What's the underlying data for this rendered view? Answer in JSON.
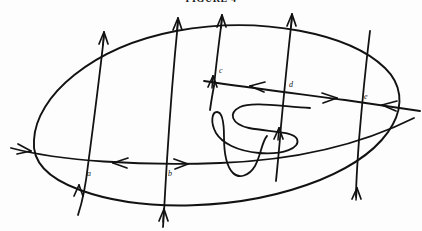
{
  "figure": {
    "caption": "FIGURE 4",
    "background_color": "#fdfdfd",
    "ink_color": "#121212",
    "width": 422,
    "height": 231,
    "kind": "hand-drawn line diagram"
  },
  "labels": {
    "a": "a",
    "b": "b",
    "c": "c",
    "d": "d",
    "e": "e"
  },
  "geometry": {
    "ellipse": {
      "name": "outer-loop",
      "path": "M 34,140 C 36,96 92,47 176,31 C 262,15 350,34 385,68 C 418,100 394,150 320,180 C 240,212 140,212 80,190 C 44,177 32,160 34,140 Z"
    },
    "vertical_curves": [
      {
        "name": "curve-a",
        "path": "M 104,33 C 100,70 94,120 88,165 C 84,192 80,204 78,214",
        "arrow_top": {
          "x": 104,
          "y": 33,
          "dir": "up"
        },
        "arrow_bottom": {
          "x": 78,
          "y": 186,
          "dir": "up"
        },
        "label": "a",
        "label_x": 87,
        "label_y": 175
      },
      {
        "name": "curve-b",
        "path": "M 178,19 C 174,60 170,110 166,160 C 164,192 164,212 163,226",
        "arrow_top": {
          "x": 178,
          "y": 19,
          "dir": "up"
        },
        "arrow_bottom": {
          "x": 163,
          "y": 211,
          "dir": "up"
        },
        "label": "b",
        "label_x": 168,
        "label_y": 176
      },
      {
        "name": "curve-c",
        "path": "M 222,16 C 219,40 216,66 214,86 C 212,96 211,102 210,108",
        "arrow_top": {
          "x": 222,
          "y": 16,
          "dir": "up"
        },
        "arrow_bottom": {
          "x": 212,
          "y": 78,
          "dir": "up"
        },
        "label": "c",
        "label_x": 219,
        "label_y": 72
      },
      {
        "name": "curve-d",
        "path": "M 292,15 C 288,50 284,94 281,126 C 279,150 277,168 276,180",
        "arrow_top": {
          "x": 292,
          "y": 15,
          "dir": "up"
        },
        "arrow_bottom": {
          "x": 278,
          "y": 132,
          "dir": "up"
        },
        "label": "d",
        "label_x": 289,
        "label_y": 86
      },
      {
        "name": "curve-e",
        "path": "M 370,31 C 366,64 362,104 359,140 C 357,168 356,184 356,196",
        "arrow_top": null,
        "arrow_bottom": {
          "x": 356,
          "y": 192,
          "dir": "up"
        },
        "label": "e",
        "label_x": 364,
        "label_y": 98
      }
    ],
    "horizontal_curves": [
      {
        "name": "lower-transversal",
        "path": "M 11,148 C 60,160 140,165 220,163 C 300,160 360,145 412,120",
        "arrows": [
          {
            "x": 25,
            "y": 150,
            "dir": "right"
          },
          {
            "x": 118,
            "y": 163,
            "dir": "left"
          },
          {
            "x": 181,
            "y": 164,
            "dir": "right"
          }
        ]
      },
      {
        "name": "upper-transversal",
        "path": "M 206,82 C 250,88 300,94 345,100 C 380,105 405,108 418,110",
        "arrows": [
          {
            "x": 257,
            "y": 87,
            "dir": "left"
          },
          {
            "x": 330,
            "y": 97,
            "dir": "right"
          },
          {
            "x": 388,
            "y": 106,
            "dir": "left"
          }
        ]
      }
    ],
    "squiggle": {
      "name": "spiral-squiggle",
      "path": "M 308,108 C 280,106 250,102 238,108 C 226,114 230,124 248,128 C 268,132 292,132 296,140 C 300,148 282,154 258,152 C 236,150 222,142 216,132 C 210,122 212,112 217,112 C 222,112 224,122 224,136 C 224,152 226,166 232,172 C 238,178 248,176 254,166 C 260,156 262,142 266,136",
      "arrow": {
        "x": 277,
        "y": 131,
        "dir": "up"
      }
    }
  }
}
